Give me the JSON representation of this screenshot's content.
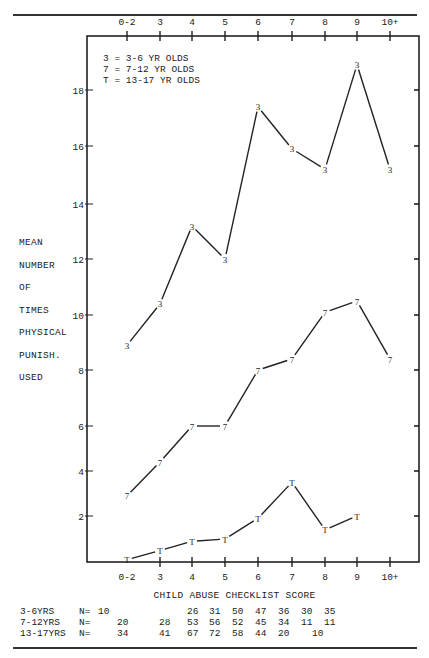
{
  "chart_data": {
    "type": "line",
    "title": "",
    "xlabel": "CHILD ABUSE CHECKLIST SCORE",
    "ylabel": "MEAN NUMBER OF TIMES PHYSICAL PUNISH. USED",
    "ylabel_lines": [
      "MEAN",
      "NUMBER",
      "OF",
      "TIMES",
      "PHYSICAL",
      "PUNISH.",
      "USED"
    ],
    "categories": [
      "0-2",
      "3",
      "4",
      "5",
      "6",
      "7",
      "8",
      "9",
      "10+"
    ],
    "y_ticks": [
      2,
      4,
      6,
      8,
      10,
      12,
      14,
      16,
      18
    ],
    "ylim": [
      0,
      19.5
    ],
    "grid": false,
    "legend_position": "top-left inside",
    "legend": [
      {
        "marker": "3",
        "label": "3 = 3-6 YR OLDS"
      },
      {
        "marker": "7",
        "label": "7 = 7-12 YR OLDS"
      },
      {
        "marker": "T",
        "label": "T = 13-17 YR OLDS"
      }
    ],
    "series": [
      {
        "name": "3-6 YR OLDS",
        "marker": "3",
        "values": [
          8.9,
          10.4,
          13.2,
          12.0,
          17.4,
          15.9,
          15.2,
          18.9,
          15.2
        ]
      },
      {
        "name": "7-12 YR OLDS",
        "marker": "7",
        "values": [
          2.9,
          4.4,
          6.0,
          6.0,
          8.0,
          8.4,
          10.1,
          10.5,
          8.4
        ]
      },
      {
        "name": "13-17 YR OLDS",
        "marker": "T",
        "values": [
          0.1,
          0.5,
          0.9,
          1.0,
          1.9,
          3.5,
          1.4,
          2.0,
          null
        ]
      }
    ],
    "sample_sizes": {
      "3-6YRS": [
        null,
        10,
        null,
        26,
        31,
        50,
        47,
        36,
        30,
        35
      ],
      "7-12YRS": [
        20,
        28,
        53,
        56,
        52,
        45,
        34,
        11,
        11
      ],
      "13-17YRS": [
        34,
        41,
        67,
        72,
        58,
        44,
        20,
        null,
        10
      ]
    }
  },
  "legend_lines": [
    "3 = 3-6 YR OLDS",
    "7 = 7-12 YR OLDS",
    "T = 13-17 YR OLDS"
  ],
  "ylabel_lines": [
    "MEAN",
    "NUMBER",
    "OF",
    "TIMES",
    "PHYSICAL",
    "PUNISH.",
    "USED"
  ],
  "xtitle": "CHILD ABUSE CHECKLIST SCORE",
  "ntable": {
    "rows": [
      {
        "label": "3-6YRS",
        "n": "N=",
        "cells": [
          [
            "10",
            48
          ],
          [
            "26",
            137
          ],
          [
            "31",
            159
          ],
          [
            "50",
            182
          ],
          [
            "47",
            205
          ],
          [
            "36",
            228
          ],
          [
            "30",
            251
          ],
          [
            "35",
            274
          ]
        ]
      },
      {
        "label": "7-12YRS",
        "n": "N=",
        "cells": [
          [
            "20",
            67
          ],
          [
            "28",
            109
          ],
          [
            "53",
            137
          ],
          [
            "56",
            159
          ],
          [
            "52",
            182
          ],
          [
            "45",
            205
          ],
          [
            "34",
            228
          ],
          [
            "11",
            251
          ],
          [
            "11",
            274
          ]
        ]
      },
      {
        "label": "13-17YRS",
        "n": "N=",
        "cells": [
          [
            "34",
            67
          ],
          [
            "41",
            109
          ],
          [
            "67",
            137
          ],
          [
            "72",
            159
          ],
          [
            "58",
            182
          ],
          [
            "44",
            205
          ],
          [
            "20",
            228
          ],
          [
            "10",
            262
          ]
        ]
      }
    ]
  }
}
